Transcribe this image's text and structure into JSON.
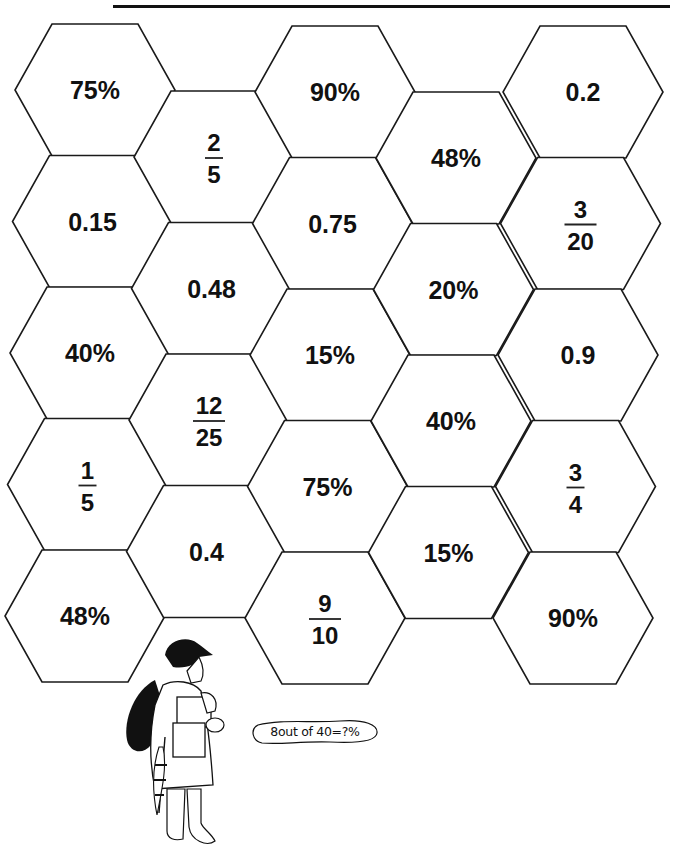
{
  "header": {
    "name_line": ""
  },
  "puzzle": {
    "hexes": [
      {
        "col": 0,
        "row": 0,
        "type": "text",
        "value": "75%"
      },
      {
        "col": 0,
        "row": 1,
        "type": "text",
        "value": "0.15"
      },
      {
        "col": 0,
        "row": 2,
        "type": "text",
        "value": "40%"
      },
      {
        "col": 0,
        "row": 3,
        "type": "fraction",
        "numerator": "1",
        "denominator": "5"
      },
      {
        "col": 0,
        "row": 4,
        "type": "text",
        "value": "48%"
      },
      {
        "col": 1,
        "row": 0,
        "type": "fraction",
        "numerator": "2",
        "denominator": "5"
      },
      {
        "col": 1,
        "row": 1,
        "type": "text",
        "value": "0.48"
      },
      {
        "col": 1,
        "row": 2,
        "type": "fraction",
        "numerator": "12",
        "denominator": "25"
      },
      {
        "col": 1,
        "row": 3,
        "type": "text",
        "value": "0.4"
      },
      {
        "col": 2,
        "row": 0,
        "type": "text",
        "value": "90%"
      },
      {
        "col": 2,
        "row": 1,
        "type": "text",
        "value": "0.75"
      },
      {
        "col": 2,
        "row": 2,
        "type": "text",
        "value": "15%"
      },
      {
        "col": 2,
        "row": 3,
        "type": "text",
        "value": "75%"
      },
      {
        "col": 2,
        "row": 4,
        "type": "fraction",
        "numerator": "9",
        "denominator": "10"
      },
      {
        "col": 3,
        "row": 0,
        "type": "text",
        "value": "48%"
      },
      {
        "col": 3,
        "row": 1,
        "type": "text",
        "value": "20%"
      },
      {
        "col": 3,
        "row": 2,
        "type": "text",
        "value": "40%"
      },
      {
        "col": 3,
        "row": 3,
        "type": "text",
        "value": "15%"
      },
      {
        "col": 4,
        "row": 0,
        "type": "text",
        "value": "0.2"
      },
      {
        "col": 4,
        "row": 1,
        "type": "fraction",
        "numerator": "3",
        "denominator": "20"
      },
      {
        "col": 4,
        "row": 2,
        "type": "text",
        "value": "0.9"
      },
      {
        "col": 4,
        "row": 3,
        "type": "fraction",
        "numerator": "3",
        "denominator": "4"
      },
      {
        "col": 4,
        "row": 4,
        "type": "text",
        "value": "90%"
      }
    ]
  },
  "illustration": {
    "speech_bubble": "8out of 40=?%",
    "figure": "girl-carrying-packages-with-umbrella"
  },
  "colors": {
    "ink": "#111111",
    "paper": "#ffffff"
  }
}
